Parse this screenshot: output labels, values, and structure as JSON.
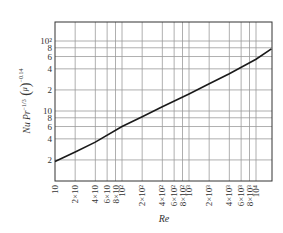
{
  "chart_data": {
    "type": "line",
    "title": "",
    "xlabel": "Re",
    "ylabel": "Nu Pr^-1/3 (μ/μw)^-0.14",
    "ylabel_parts": {
      "main": "Nu Pr",
      "pr_exp": "−1/3",
      "mu": "μ",
      "muw": "μ",
      "muw_sub": "w",
      "exp": "−0.14"
    },
    "xscale": "log",
    "yscale": "log",
    "xlim": [
      10,
      17000
    ],
    "ylim": [
      1,
      200
    ],
    "grid": true,
    "legend": null,
    "x_ticks": [
      {
        "value": 10,
        "label": "10"
      },
      {
        "value": 20,
        "label": "2×10"
      },
      {
        "value": 40,
        "label": "4×10"
      },
      {
        "value": 60,
        "label": "6×10"
      },
      {
        "value": 80,
        "label": "8×10"
      },
      {
        "value": 100,
        "label": "10²"
      },
      {
        "value": 200,
        "label": "2×10²"
      },
      {
        "value": 400,
        "label": "4×10²"
      },
      {
        "value": 600,
        "label": "6×10²"
      },
      {
        "value": 800,
        "label": "8×10²"
      },
      {
        "value": 1000,
        "label": "10³"
      },
      {
        "value": 2000,
        "label": "2×10³"
      },
      {
        "value": 4000,
        "label": "4×10³"
      },
      {
        "value": 6000,
        "label": "6×10³"
      },
      {
        "value": 8000,
        "label": "8×10³"
      },
      {
        "value": 10000,
        "label": "10⁴"
      }
    ],
    "y_ticks": [
      {
        "value": 2,
        "label": "2"
      },
      {
        "value": 4,
        "label": "4"
      },
      {
        "value": 6,
        "label": "6"
      },
      {
        "value": 8,
        "label": "8"
      },
      {
        "value": 10,
        "label": "10"
      },
      {
        "value": 20,
        "label": "2"
      },
      {
        "value": 40,
        "label": "4"
      },
      {
        "value": 60,
        "label": "6"
      },
      {
        "value": 80,
        "label": "8"
      },
      {
        "value": 100,
        "label": "10²"
      }
    ],
    "series": [
      {
        "name": "Nu Pr^-1/3 (μ/μw)^-0.14 vs Re",
        "color": "#1a1a1a",
        "x": [
          10,
          20,
          40,
          100,
          200,
          400,
          1000,
          2000,
          4000,
          10000,
          17000
        ],
        "y": [
          1.9,
          2.6,
          3.6,
          6.0,
          8.3,
          11.5,
          17.5,
          24.5,
          34,
          55,
          77
        ]
      }
    ]
  }
}
